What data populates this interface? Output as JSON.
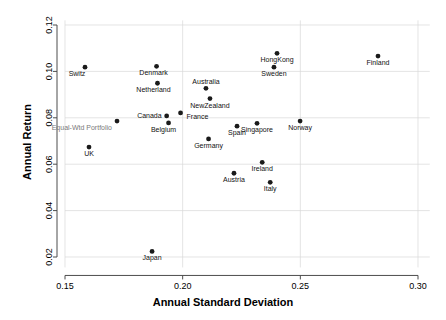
{
  "chart_data": {
    "type": "scatter",
    "title": "",
    "subtitle": "",
    "xlabel": "Annual Standard Deviation",
    "ylabel": "Annual Return",
    "xlim": [
      0.15,
      0.305
    ],
    "ylim": [
      0.0155,
      0.122
    ],
    "xticks": [
      0.15,
      0.2,
      0.25,
      0.3
    ],
    "xtick_labels": [
      "0.15",
      "0.20",
      "0.25",
      "0.30"
    ],
    "yticks": [
      0.02,
      0.04,
      0.06,
      0.08,
      0.1,
      0.12
    ],
    "ytick_labels": [
      "0.02",
      "0.04",
      "0.06",
      "0.08",
      "0.10",
      "0.12"
    ],
    "grid": true,
    "grid_color": "#d9d9d9",
    "legend": "none",
    "marker_color": "#1a1a1a",
    "marker_size": 3,
    "points": [
      {
        "label": "Switz",
        "x": 0.1585,
        "y": 0.1018,
        "lx": -8,
        "ly": 9,
        "anchor": "middle",
        "color": "#111111"
      },
      {
        "label": "UK",
        "x": 0.1602,
        "y": 0.0674,
        "lx": 0,
        "ly": 9,
        "anchor": "middle",
        "color": "#111111"
      },
      {
        "label": "Equal-Wtd Portfolio",
        "x": 0.1721,
        "y": 0.0786,
        "lx": -5,
        "ly": 9,
        "anchor": "end",
        "color": "#7a7a7a"
      },
      {
        "label": "Japan",
        "x": 0.187,
        "y": 0.0224,
        "lx": 0,
        "ly": 9,
        "anchor": "middle",
        "color": "#111111"
      },
      {
        "label": "Denmark",
        "x": 0.1889,
        "y": 0.1022,
        "lx": -3,
        "ly": 9,
        "anchor": "middle",
        "color": "#111111"
      },
      {
        "label": "Netherland",
        "x": 0.1893,
        "y": 0.0949,
        "lx": -4,
        "ly": 9,
        "anchor": "middle",
        "color": "#111111"
      },
      {
        "label": "Canada",
        "x": 0.1932,
        "y": 0.0808,
        "lx": -5,
        "ly": 2,
        "anchor": "end",
        "color": "#111111"
      },
      {
        "label": "Belgium",
        "x": 0.194,
        "y": 0.0778,
        "lx": -5,
        "ly": 9,
        "anchor": "middle",
        "color": "#111111"
      },
      {
        "label": "France",
        "x": 0.1991,
        "y": 0.0821,
        "lx": 6,
        "ly": 6,
        "anchor": "start",
        "color": "#111111"
      },
      {
        "label": "Germany",
        "x": 0.211,
        "y": 0.0709,
        "lx": 0,
        "ly": 9,
        "anchor": "middle",
        "color": "#111111"
      },
      {
        "label": "Australia",
        "x": 0.2099,
        "y": 0.0927,
        "lx": 0,
        "ly": -4,
        "anchor": "middle",
        "color": "#111111"
      },
      {
        "label": "NewZealand",
        "x": 0.2116,
        "y": 0.0883,
        "lx": 0,
        "ly": 9,
        "anchor": "middle",
        "color": "#111111"
      },
      {
        "label": "Austria",
        "x": 0.2218,
        "y": 0.0561,
        "lx": 0,
        "ly": 9,
        "anchor": "middle",
        "color": "#111111"
      },
      {
        "label": "Spain",
        "x": 0.2231,
        "y": 0.0764,
        "lx": 0,
        "ly": 9,
        "anchor": "middle",
        "color": "#111111"
      },
      {
        "label": "Singapore",
        "x": 0.2316,
        "y": 0.0776,
        "lx": 0,
        "ly": 9,
        "anchor": "middle",
        "color": "#111111"
      },
      {
        "label": "Sweden",
        "x": 0.2388,
        "y": 0.1018,
        "lx": 0,
        "ly": 9,
        "anchor": "middle",
        "color": "#111111"
      },
      {
        "label": "HongKong",
        "x": 0.2401,
        "y": 0.1078,
        "lx": 0,
        "ly": 9,
        "anchor": "middle",
        "color": "#111111"
      },
      {
        "label": "Ireland",
        "x": 0.2338,
        "y": 0.0608,
        "lx": 0,
        "ly": 9,
        "anchor": "middle",
        "color": "#111111"
      },
      {
        "label": "Italy",
        "x": 0.2372,
        "y": 0.0522,
        "lx": 0,
        "ly": 9,
        "anchor": "middle",
        "color": "#111111"
      },
      {
        "label": "Norway",
        "x": 0.2499,
        "y": 0.0786,
        "lx": 0,
        "ly": 9,
        "anchor": "middle",
        "color": "#111111"
      },
      {
        "label": "Finland",
        "x": 0.283,
        "y": 0.1066,
        "lx": 0,
        "ly": 9,
        "anchor": "middle",
        "color": "#111111"
      }
    ]
  }
}
